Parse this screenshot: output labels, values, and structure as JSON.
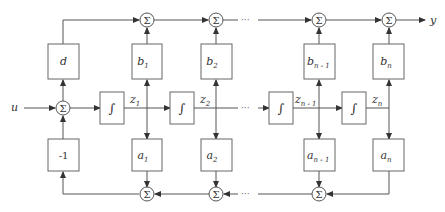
{
  "diagram": {
    "input_label": "u",
    "output_label": "y",
    "sum_symbol": "Σ",
    "integrator_symbol": "∫",
    "ellipsis": "···",
    "feedthrough": {
      "label": "d"
    },
    "neg_gain": {
      "label": "-1"
    },
    "b_gains": [
      {
        "base": "b",
        "sub": "1"
      },
      {
        "base": "b",
        "sub": "2"
      },
      {
        "base": "b",
        "sub": "n - 1"
      },
      {
        "base": "b",
        "sub": "n"
      }
    ],
    "a_gains": [
      {
        "base": "a",
        "sub": "1"
      },
      {
        "base": "a",
        "sub": "2"
      },
      {
        "base": "a",
        "sub": "n - 1"
      },
      {
        "base": "a",
        "sub": "n"
      }
    ],
    "states": [
      {
        "base": "z",
        "sub": "1"
      },
      {
        "base": "z",
        "sub": "2"
      },
      {
        "base": "z",
        "sub": "n - 1"
      },
      {
        "base": "z",
        "sub": "n"
      }
    ]
  }
}
